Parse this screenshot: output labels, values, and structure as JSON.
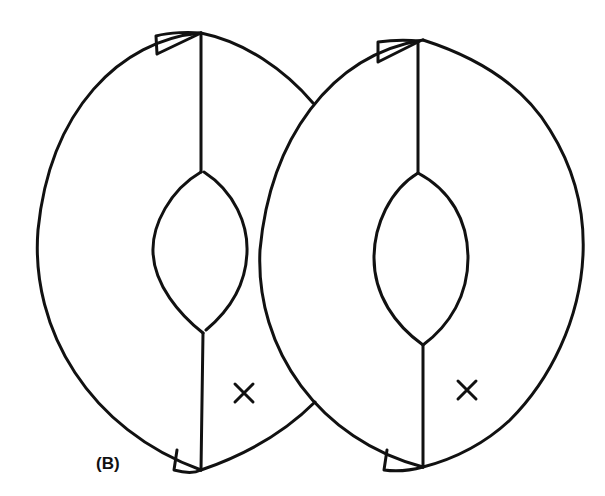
{
  "figure": {
    "panel_label": "(B)",
    "left_shape": {
      "mark": "×",
      "has_inner_lens": true,
      "has_top_tab": true,
      "has_bottom_tab": true
    },
    "right_shape": {
      "mark": "×",
      "has_inner_lens": true,
      "has_top_tab": true,
      "has_bottom_tab": true
    },
    "stroke_color": "#111111",
    "background_color": "#ffffff"
  }
}
